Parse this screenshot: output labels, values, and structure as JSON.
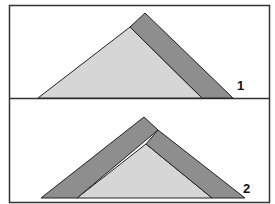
{
  "panels": [
    {
      "label": "1",
      "description": "Triangle with single diagonal plank leaning on right side"
    },
    {
      "label": "2",
      "description": "Triangle with two planks forming a roof over it"
    }
  ],
  "colors": {
    "frame": "#333333",
    "triangle_fill": "#d6d6d6",
    "plank_fill": "#8e8e8e",
    "background": "#ffffff"
  }
}
